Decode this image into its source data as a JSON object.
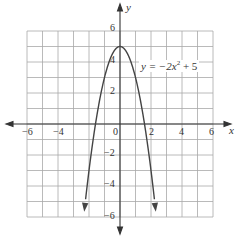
{
  "chart_data": {
    "type": "line",
    "title": "",
    "equation": "y = −2x² + 5",
    "xlabel": "x",
    "ylabel": "y",
    "xlim": [
      -6,
      6
    ],
    "ylim": [
      -6,
      6
    ],
    "grid": true,
    "x_ticks": [
      "-6",
      "-4",
      "0",
      "2",
      "4",
      "6"
    ],
    "y_ticks": [
      "6",
      "4",
      "2",
      "-2",
      "-4",
      "-6"
    ],
    "series": [
      {
        "name": "y = −2x² + 5",
        "x": [
          -2.3,
          -2,
          -1.5,
          -1,
          -0.5,
          0,
          0.5,
          1,
          1.5,
          2,
          2.3
        ],
        "y": [
          -5.58,
          -3,
          0.5,
          3,
          4.5,
          5,
          4.5,
          3,
          0.5,
          -3,
          -5.58
        ]
      }
    ],
    "annotations": [
      {
        "text": "y = −2x² + 5",
        "x": 1.3,
        "y": 4
      }
    ]
  },
  "labels": {
    "x_axis": "x",
    "y_axis": "y",
    "equation_prefix": "y = −2x",
    "equation_exp": "2",
    "equation_suffix": " + 5",
    "tick_x_m6": "−6",
    "tick_x_m4": "−4",
    "tick_x_0": "0",
    "tick_x_2": "2",
    "tick_x_4": "4",
    "tick_x_6": "6",
    "tick_y_6": "6",
    "tick_y_4": "4",
    "tick_y_2": "2",
    "tick_y_m2": "−2",
    "tick_y_m4": "−4",
    "tick_y_m6": "−6"
  },
  "colors": {
    "grid": "#9a9a9a",
    "axis": "#333333",
    "curve": "#444444"
  }
}
